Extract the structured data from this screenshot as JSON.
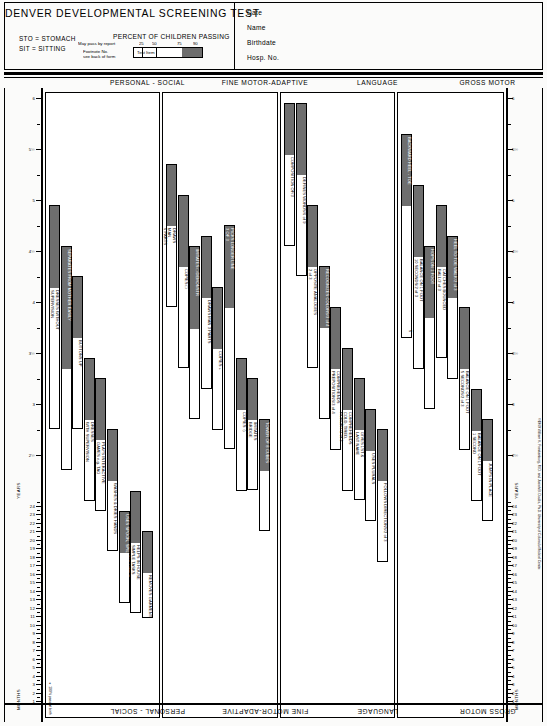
{
  "header": {
    "title": "DENVER DEVELOPMENTAL SCREENING TEST",
    "abbr1": "STO = STOMACH",
    "abbr2": "SIT = SITTING",
    "percent_title": "PERCENT OF CHILDREN PASSING",
    "scale_ticks": [
      "25",
      "50",
      "75",
      "90"
    ],
    "legend_item_label": "Test Item",
    "ann_may_pass": "May pass by report",
    "ann_footnote1": "Footnote No.",
    "ann_footnote2": "see back of form",
    "fields": [
      "Date",
      "Name",
      "Birthdate",
      "Hosp. No."
    ]
  },
  "columns": [
    {
      "key": "personal_social",
      "label": "PERSONAL - SOCIAL"
    },
    {
      "key": "fine_motor",
      "label": "FINE MOTOR-ADAPTIVE"
    },
    {
      "key": "language",
      "label": "LANGUAGE"
    },
    {
      "key": "gross_motor",
      "label": "GROSS MOTOR"
    }
  ],
  "axis": {
    "months_label": "MONTHS",
    "years_label": "YEARS",
    "month_ticks": [
      "1",
      "2",
      "3",
      "4",
      "5",
      "6",
      "7",
      "8",
      "9",
      "10",
      "11",
      "12",
      "13",
      "14",
      "15",
      "16",
      "17",
      "18",
      "19",
      "20",
      "21",
      "22",
      "23",
      "24"
    ],
    "year_ticks": [
      "2½",
      "3",
      "3½",
      "4",
      "4½",
      "5",
      "5½",
      "6"
    ]
  },
  "notes": {
    "pass_at_birth": "∗ 100% pass at birth",
    "copyright": "©1969 William K. Frankenburg, M.D. and Josiah B. Dodds, Ph.D.  University of Colorado Medical Center."
  },
  "chart_data": {
    "type": "bar",
    "title": "DENVER DEVELOPMENTAL SCREENING TEST",
    "xlabel": "Age (months / years)",
    "ylabel": "Developmental item",
    "note": "Each bar spans age at which 25%, 50%, 75% and 90% of children pass the item. The shaded (dark) portion runs from the 75th to 90th percentile.",
    "items": {
      "personal_social": [
        {
          "label": "DRESSES WITHOUT\nSUPERVISION",
          "p25": 2.8,
          "p50": 3.4,
          "p75": 4.2,
          "p90": 5.0
        },
        {
          "label": "SEPARATES FROM MOTHER EASILY",
          "p25": 2.4,
          "p50": 2.8,
          "p75": 3.4,
          "p90": 4.6,
          "on_fill": true
        },
        {
          "label": "BUTTONS UP",
          "p25": 2.8,
          "p50": 3.2,
          "p75": 3.7,
          "p90": 4.3
        },
        {
          "label": "DRESSES\nWITH SUPERVISION",
          "p25": 2.1,
          "p50": 2.5,
          "p75": 2.9,
          "p90": 3.5
        },
        {
          "label": "PLAYS INTERACTIVE\nGAMES e.g. TAG",
          "p25": 2.0,
          "p50": 2.3,
          "p75": 2.7,
          "p90": 3.3
        },
        {
          "label": "WASHES & DRIES HANDS",
          "p25": 1.6,
          "p50": 1.9,
          "p75": 2.3,
          "p90": 2.8
        },
        {
          "label": "USES SPOON, SPILLING LITTLE",
          "p25": 1.1,
          "p50": 1.35,
          "p75": 1.6,
          "p90": 2.0,
          "on_fill": true
        },
        {
          "label": "HELPS IN HOUSE\nSIMPLE TASKS",
          "p25": 1.0,
          "p50": 1.3,
          "p75": 1.7,
          "p90": 2.2
        },
        {
          "label": "REMOVES GARMENT",
          "p25": 0.95,
          "p50": 1.15,
          "p75": 1.4,
          "p90": 1.8
        },
        {
          "label": "DRINKS FROM CUP",
          "p25": 0.83,
          "p50": 0.95,
          "p75": 1.1,
          "p90": 1.3
        },
        {
          "label": "INDICATES WANTS\n(NOT CRY)",
          "p25": 0.9,
          "p50": 1.05,
          "p75": 1.2,
          "p90": 1.4
        },
        {
          "label": "PLAYS BALL WITH EXAMINER",
          "p25": 0.8,
          "p50": 0.95,
          "p75": 1.1,
          "p90": 1.3
        },
        {
          "label": "PLAYS PAT-A-CAKE",
          "p25": 0.58,
          "p50": 0.7,
          "p75": 0.85,
          "p90": 1.1
        },
        {
          "label": "FEEDS SELF CRACKERS",
          "p25": 0.42,
          "p50": 0.5,
          "p75": 0.58,
          "p90": 0.67,
          "on_fill": true
        },
        {
          "label": "RESISTS TOY PULL",
          "p25": 0.42,
          "p50": 0.5,
          "p75": 0.6,
          "p90": 0.72
        },
        {
          "label": "PLAYS PEEK-A-BOO",
          "p25": 0.42,
          "p50": 0.5,
          "p75": 0.58,
          "p90": 0.7,
          "on_fill": true
        },
        {
          "label": "WORKS FOR TOY\nOUT OF REACH",
          "p25": 0.42,
          "p50": 0.52,
          "p75": 0.62,
          "p90": 0.75
        },
        {
          "label": "SMILES\nSPONTANEOUSLY",
          "p25": 0.13,
          "p50": 0.17,
          "p75": 0.23,
          "p90": 0.32
        },
        {
          "label": "SMILES\nRESPONSIVELY",
          "p25": 0.04,
          "p50": 0.08,
          "p75": 0.12,
          "p90": 0.17,
          "on_fill": true
        },
        {
          "label": "REGARDS FACE",
          "p25": 0.0,
          "p50": 0.0,
          "p75": 0.02,
          "p90": 0.04,
          "on_fill": true
        }
      ],
      "fine_motor": [
        {
          "label": "DRAWS\nMAN\n6 PARTS",
          "p25": 4.0,
          "p50": 4.4,
          "p75": 4.8,
          "p90": 5.4
        },
        {
          "label": "COPIES □",
          "p25": 3.4,
          "p50": 3.9,
          "p75": 4.4,
          "p90": 5.1
        },
        {
          "label": "IMITATES □ DEMONSTR",
          "p25": 2.9,
          "p50": 3.3,
          "p75": 3.8,
          "p90": 4.6,
          "on_fill": true
        },
        {
          "label": "DRAWS MAN 3 PARTS",
          "p25": 3.2,
          "p50": 3.6,
          "p75": 4.1,
          "p90": 4.7
        },
        {
          "label": "COPIES +",
          "p25": 2.8,
          "p50": 3.2,
          "p75": 3.6,
          "p90": 4.2
        },
        {
          "label": "PICKS LONGER LINE\n3 OF 3",
          "p25": 2.6,
          "p50": 3.2,
          "p75": 4.0,
          "p90": 4.8,
          "on_fill": true
        },
        {
          "label": "COPIES ◇",
          "p25": 2.2,
          "p50": 2.6,
          "p75": 3.0,
          "p90": 3.5
        },
        {
          "label": "IMITATES\nBRIDGE",
          "p25": 2.2,
          "p50": 2.5,
          "p75": 2.9,
          "p90": 3.3
        },
        {
          "label": "TOWER OF 8 CUBES",
          "p25": 1.8,
          "p50": 2.1,
          "p75": 2.4,
          "p90": 2.9,
          "on_fill": true
        },
        {
          "label": "TOWER OF 4 CUBES",
          "p25": 1.4,
          "p50": 1.6,
          "p75": 1.9,
          "p90": 2.3
        },
        {
          "label": "IMITATES VERTICAL LINE\nWITHIN 30°",
          "p25": 1.5,
          "p50": 1.8,
          "p75": 2.1,
          "p90": 2.5
        },
        {
          "label": "DUMPS RAISIN FROM BOTTLE-SPONT",
          "p25": 1.1,
          "p50": 1.3,
          "p75": 1.5,
          "p90": 1.8
        },
        {
          "label": "SCRIBBLES SPONTANEOUSLY",
          "p25": 1.0,
          "p50": 1.2,
          "p75": 1.4,
          "p90": 1.7,
          "on_fill": true
        },
        {
          "label": "TOWER OF 2 CUBES",
          "p25": 0.95,
          "p50": 1.1,
          "p75": 1.3,
          "p90": 1.6
        },
        {
          "label": "DUMPS RAISIN FROM BOTTLE DEMONSTR",
          "p25": 0.9,
          "p50": 1.1,
          "p75": 1.3,
          "p90": 1.6,
          "on_fill": true
        },
        {
          "label": "BANGS 2 CUBES HELD IN HANDS",
          "p25": 0.6,
          "p50": 0.7,
          "p75": 0.8,
          "p90": 0.95,
          "on_fill": true
        },
        {
          "label": "NEAT PINCER GRASP\nOF RAISIN",
          "p25": 0.7,
          "p50": 0.8,
          "p75": 0.9,
          "p90": 1.05
        },
        {
          "label": "THUMB-FINGER GRASP",
          "p25": 0.58,
          "p50": 0.67,
          "p75": 0.75,
          "p90": 0.85,
          "on_fill": true
        },
        {
          "label": "SIT. LOOKS\nFOR YARN",
          "p25": 0.42,
          "p50": 0.5,
          "p75": 0.58,
          "p90": 0.67
        },
        {
          "label": "SIT. TAKES\n2 CUBES",
          "p25": 0.5,
          "p50": 0.58,
          "p75": 0.67,
          "p90": 0.75
        },
        {
          "label": "PASSES CUBE\nHAND TO HAND",
          "p25": 0.42,
          "p50": 0.5,
          "p75": 0.58,
          "p90": 0.7
        },
        {
          "label": "RAKES RAISIN ATTAINS",
          "p25": 0.4,
          "p50": 0.47,
          "p75": 0.55,
          "p90": 0.65
        },
        {
          "label": "GRASPS\nRATTLE",
          "p25": 0.17,
          "p50": 0.25,
          "p75": 0.3,
          "p90": 0.37
        },
        {
          "label": "REGARDS\nRAISIN",
          "p25": 0.17,
          "p50": 0.23,
          "p75": 0.3,
          "p90": 0.4
        },
        {
          "label": "REACHES\nFOR OBJECT",
          "p25": 0.25,
          "p50": 0.3,
          "p75": 0.37,
          "p90": 0.45
        },
        {
          "label": "HANDS\nTOGETHER",
          "p25": 0.17,
          "p50": 0.23,
          "p75": 0.28,
          "p90": 0.35
        },
        {
          "label": "FOLLOWS 180°",
          "p25": 0.12,
          "p50": 0.17,
          "p75": 0.23,
          "p90": 0.3
        },
        {
          "label": "FOLLOWS PAST\nMIDLINE",
          "p25": 0.04,
          "p50": 0.08,
          "p75": 0.13,
          "p90": 0.2
        },
        {
          "label": "FOCAL ATTENTIVITY",
          "p25": 0.0,
          "p50": 0.02,
          "p75": 0.06,
          "p90": 0.1,
          "on_fill": true
        },
        {
          "label": "FOLLOWS\nTO MIDLINE",
          "p25": 0.0,
          "p50": 0.02,
          "p75": 0.05,
          "p90": 0.09
        }
      ],
      "language": [
        {
          "label": "COMPOSITION OF/3",
          "p25": 4.6,
          "p50": 5.0,
          "p75": 5.5,
          "p90": 6.0,
          "badge": "87%"
        },
        {
          "label": "DEFINES WORDS/6 of 9",
          "p25": 4.3,
          "p50": 4.8,
          "p75": 5.3,
          "p90": 6.0,
          "badge": "87%"
        },
        {
          "label": "OPPOSITE ANALOGIES\n2 of 3",
          "p25": 3.4,
          "p50": 3.9,
          "p75": 4.4,
          "p90": 5.0
        },
        {
          "label": "RECOGNIZES COLORS/3 of 4",
          "p25": 2.9,
          "p50": 3.3,
          "p75": 3.8,
          "p90": 4.4,
          "on_fill": true
        },
        {
          "label": "COMPREHENDS\nPREPOSITIONS/3 of 4",
          "p25": 2.6,
          "p50": 3.0,
          "p75": 3.4,
          "p90": 4.0
        },
        {
          "label": "COMPREHENDS\nCOLD, TIRED,\nHUNGRY/2 of 3",
          "p25": 2.2,
          "p50": 2.6,
          "p75": 3.0,
          "p90": 3.6
        },
        {
          "label": "GIVES 1ST &\nLAST NAME",
          "p25": 2.1,
          "p50": 2.4,
          "p75": 2.8,
          "p90": 3.3
        },
        {
          "label": "USES PLURALS",
          "p25": 1.9,
          "p50": 2.2,
          "p75": 2.6,
          "p90": 3.0
        },
        {
          "label": "FOLLOWS DIRECTIONS/2 of 3",
          "p25": 1.5,
          "p50": 1.9,
          "p75": 2.3,
          "p90": 2.8
        },
        {
          "label": "NAMES 1 PICTURE",
          "p25": 1.4,
          "p50": 1.6,
          "p75": 1.9,
          "p90": 2.2
        },
        {
          "label": "POINTS TO 1 NAMED\nBODY PART",
          "p25": 1.2,
          "p50": 1.4,
          "p75": 1.6,
          "p90": 1.9
        },
        {
          "label": "COMBINES 2 DIFFERENT WORDS",
          "p25": 1.3,
          "p50": 1.5,
          "p75": 1.7,
          "p90": 2.0
        },
        {
          "label": "3 WORDS OTHER THAN MAMA, DADA",
          "p25": 1.0,
          "p50": 1.15,
          "p75": 1.3,
          "p90": 1.55,
          "on_fill": true
        },
        {
          "label": "DADA OR MAMA,\nSPECIFIC",
          "p25": 0.8,
          "p50": 0.9,
          "p75": 1.05,
          "p90": 1.2,
          "on_fill": true
        },
        {
          "label": "IMITATES SPEECH SOUNDS",
          "p25": 0.55,
          "p50": 0.67,
          "p75": 0.8,
          "p90": 0.95,
          "on_fill": true
        },
        {
          "label": "DADA OR MAMA,\nNONSPECIFIC",
          "p25": 0.45,
          "p50": 0.55,
          "p75": 0.65,
          "p90": 0.8,
          "on_fill": true
        },
        {
          "label": "TURNS TO VOICE",
          "p25": 0.37,
          "p50": 0.45,
          "p75": 0.52,
          "p90": 0.6
        },
        {
          "label": "SQUEALS",
          "p25": 0.12,
          "p50": 0.17,
          "p75": 0.23,
          "p90": 0.3
        },
        {
          "label": "LAUGHS",
          "p25": 0.13,
          "p50": 0.17,
          "p75": 0.21,
          "p90": 0.26
        },
        {
          "label": "VOCALIZES\nNOT CRYING",
          "p25": 0.02,
          "p50": 0.05,
          "p75": 0.09,
          "p90": 0.13,
          "on_fill": true
        },
        {
          "label": "RESPONDS\nTO BELL",
          "p25": 0.0,
          "p50": 0.01,
          "p75": 0.03,
          "p90": 0.06,
          "on_fill": true
        }
      ],
      "gross_motor": [
        {
          "label": "BACKWARD HEEL - TOE",
          "p25": 3.7,
          "p50": 4.3,
          "p75": 5.0,
          "p90": 5.7,
          "badge": "5 OF 5",
          "on_fill": true
        },
        {
          "label": "BALANCE ON 1 FOOT\n10 SECONDS/2 of 3",
          "p25": 3.4,
          "p50": 3.9,
          "p75": 4.5,
          "p90": 5.2
        },
        {
          "label": "HOPS ON 1 FOOT",
          "p25": 3.0,
          "p50": 3.4,
          "p75": 3.9,
          "p90": 4.6,
          "on_fill": true
        },
        {
          "label": "CATCHES BOUNCED\nBALL/2 of 3",
          "p25": 3.5,
          "p50": 3.9,
          "p75": 4.4,
          "p90": 5.0
        },
        {
          "label": "HEEL TO TOE WALK/2 of 3",
          "p25": 3.3,
          "p50": 3.7,
          "p75": 4.1,
          "p90": 4.7,
          "on_fill": true
        },
        {
          "label": "BALANCE ON 1 FOOT\n5 SECONDS/2 of 3",
          "p25": 2.6,
          "p50": 3.0,
          "p75": 3.4,
          "p90": 4.0
        },
        {
          "label": "BALANCE ON 1 FOOT\n1 SECOND",
          "p25": 2.1,
          "p50": 2.4,
          "p75": 2.8,
          "p90": 3.2
        },
        {
          "label": "JUMPS IN PLACE",
          "p25": 1.9,
          "p50": 2.2,
          "p75": 2.5,
          "p90": 2.9
        },
        {
          "label": "PEDALS TRICYCLE",
          "p25": 2.0,
          "p50": 2.3,
          "p75": 2.6,
          "p90": 3.0
        },
        {
          "label": "BROAD JUMP",
          "p25": 2.1,
          "p50": 2.4,
          "p75": 2.7,
          "p90": 3.0
        },
        {
          "label": "THROWS BALL OVERHAND",
          "p25": 1.3,
          "p50": 1.5,
          "p75": 1.8,
          "p90": 2.2
        },
        {
          "label": "KICKS BALL FORWARD",
          "p25": 1.5,
          "p50": 1.7,
          "p75": 1.9,
          "p90": 2.1
        },
        {
          "label": "WALKS UP STEPS",
          "p25": 1.1,
          "p50": 1.25,
          "p75": 1.45,
          "p90": 1.8
        },
        {
          "label": "WALKS BACKWARDS",
          "p25": 1.0,
          "p50": 1.15,
          "p75": 1.3,
          "p90": 1.5
        },
        {
          "label": "WALKS WELL",
          "p25": 0.95,
          "p50": 1.05,
          "p75": 1.2,
          "p90": 1.3
        },
        {
          "label": "STOOPS & RECOVERS",
          "p25": 0.9,
          "p50": 1.0,
          "p75": 1.1,
          "p90": 1.25
        },
        {
          "label": "STANDS ALONE WELL",
          "p25": 0.85,
          "p50": 0.95,
          "p75": 1.05,
          "p90": 1.2
        },
        {
          "label": "WALKS HOLDING ON FURNITURE",
          "p25": 0.62,
          "p50": 0.75,
          "p75": 0.9,
          "p90": 1.1,
          "on_fill": true
        },
        {
          "label": "STANDS MOMENTARILY",
          "p25": 0.8,
          "p50": 0.9,
          "p75": 1.0,
          "p90": 1.15
        },
        {
          "label": "PULLS SELF TO STAND",
          "p25": 0.58,
          "p50": 0.67,
          "p75": 0.75,
          "p90": 0.85
        },
        {
          "label": "STANDS HOLDING ON",
          "p25": 0.42,
          "p50": 0.5,
          "p75": 0.6,
          "p90": 0.72
        },
        {
          "label": "GETS TO SITTING",
          "p25": 0.55,
          "p50": 0.65,
          "p75": 0.75,
          "p90": 0.9
        },
        {
          "label": "SITS WITHOUT\nSUPPORT",
          "p25": 0.4,
          "p50": 0.48,
          "p75": 0.55,
          "p90": 0.65
        },
        {
          "label": "BEAR SOME WEIGHT ON LEGS",
          "p25": 0.2,
          "p50": 0.3,
          "p75": 0.4,
          "p90": 0.55,
          "on_fill": true
        },
        {
          "label": "PULL TO SIT\nNO HEAD LAG",
          "p25": 0.25,
          "p50": 0.3,
          "p75": 0.37,
          "p90": 0.45
        },
        {
          "label": "ROLLS OVER",
          "p25": 0.17,
          "p50": 0.23,
          "p75": 0.28,
          "p90": 0.35
        },
        {
          "label": "STO CHEST UP\nARM SUPPORT",
          "p25": 0.12,
          "p50": 0.17,
          "p75": 0.22,
          "p90": 0.28
        },
        {
          "label": "SIT - HEAD\nSTEADY",
          "p25": 0.12,
          "p50": 0.17,
          "p75": 0.21,
          "p90": 0.26
        },
        {
          "label": "STO HEAD UP 90°",
          "p25": 0.08,
          "p50": 0.12,
          "p75": 0.16,
          "p90": 0.21
        },
        {
          "label": "STO HEAD UP 45°",
          "p25": 0.04,
          "p50": 0.07,
          "p75": 0.1,
          "p90": 0.14
        },
        {
          "label": "STO LIFTS\nHEAD",
          "p25": 0.0,
          "p50": 0.01,
          "p75": 0.03,
          "p90": 0.06,
          "on_fill": true
        }
      ]
    }
  }
}
